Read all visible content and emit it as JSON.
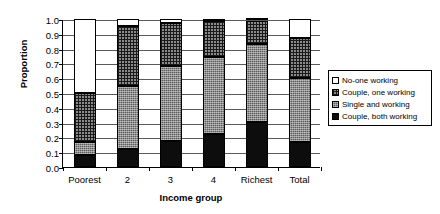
{
  "chart_data": {
    "type": "bar",
    "stacked": true,
    "title": "",
    "xlabel": "Income group",
    "ylabel": "Proportion",
    "ylim": [
      0,
      1
    ],
    "ytick_labels": [
      "1.0",
      "0.9",
      "0.8",
      "0.7",
      "0.6",
      "0.5",
      "0.4",
      "0.3",
      "0.2",
      "0.1",
      "0.0"
    ],
    "ytick_values": [
      1.0,
      0.9,
      0.8,
      0.7,
      0.6,
      0.5,
      0.4,
      0.3,
      0.2,
      0.1,
      0.0
    ],
    "grid": true,
    "legend_position": "right",
    "categories": [
      "Poorest",
      "2",
      "3",
      "4",
      "Richest",
      "Total"
    ],
    "series": [
      {
        "name": "Couple, both working",
        "pattern": "solid-black",
        "color": "#0d0d0d",
        "values": [
          0.08,
          0.12,
          0.175,
          0.225,
          0.305,
          0.17
        ]
      },
      {
        "name": "Single and working",
        "pattern": "fine-crosshatch-grey",
        "color": "#5d5d5d",
        "values": [
          0.09,
          0.425,
          0.505,
          0.52,
          0.525,
          0.43
        ]
      },
      {
        "name": "Couple, one working",
        "pattern": "grid-crosshatch",
        "color": "#8a8a8a",
        "values": [
          0.33,
          0.41,
          0.295,
          0.24,
          0.16,
          0.275
        ]
      },
      {
        "name": "No-one working",
        "pattern": "white",
        "color": "#ffffff",
        "values": [
          0.5,
          0.045,
          0.025,
          0.015,
          0.01,
          0.125
        ]
      }
    ],
    "cumulative_tops": {
      "Poorest": [
        0.08,
        0.17,
        0.5,
        1.0
      ],
      "2": [
        0.12,
        0.545,
        0.955,
        1.0
      ],
      "3": [
        0.175,
        0.68,
        0.975,
        1.0
      ],
      "4": [
        0.225,
        0.745,
        0.985,
        1.0
      ],
      "Richest": [
        0.305,
        0.83,
        0.99,
        1.0
      ],
      "Total": [
        0.17,
        0.6,
        0.875,
        1.0
      ]
    }
  },
  "legend": {
    "items": [
      {
        "label": "No-one working",
        "swatch": "white"
      },
      {
        "label": "Couple, one working",
        "swatch": "grid-crosshatch"
      },
      {
        "label": "Single and working",
        "swatch": "fine-crosshatch-grey"
      },
      {
        "label": "Couple, both working",
        "swatch": "solid-black"
      }
    ]
  }
}
